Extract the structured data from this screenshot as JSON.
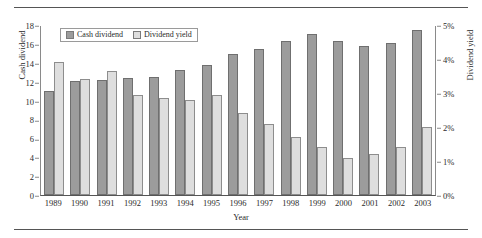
{
  "chart_data": {
    "type": "bar",
    "title": "",
    "subtitle": "",
    "xlabel": "Year",
    "ylabel": "Cash dividend",
    "y2label": "Dividend yield",
    "categories": [
      "1989",
      "1990",
      "1991",
      "1992",
      "1993",
      "1994",
      "1995",
      "1996",
      "1997",
      "1998",
      "1999",
      "2000",
      "2001",
      "2002",
      "2003"
    ],
    "ylim": [
      0,
      18
    ],
    "y2lim": [
      0,
      5
    ],
    "yticks": [
      "18",
      "16",
      "14",
      "12",
      "10",
      "8",
      "6",
      "4",
      "2",
      "0"
    ],
    "ytick_values": [
      18,
      16,
      14,
      12,
      10,
      8,
      6,
      4,
      2,
      0
    ],
    "y2ticks": [
      "5%",
      "4%",
      "3%",
      "2%",
      "1%",
      "0%"
    ],
    "y2tick_values": [
      5,
      4,
      3,
      2,
      1,
      0
    ],
    "grid": false,
    "legend_position": "top-left",
    "series": [
      {
        "name": "Cash dividend",
        "axis": "left",
        "color": "#9c9c9c",
        "values": [
          11.0,
          12.1,
          12.2,
          12.4,
          12.5,
          13.2,
          13.8,
          14.9,
          15.5,
          16.3,
          17.1,
          16.3,
          15.8,
          16.1,
          17.5
        ]
      },
      {
        "name": "Dividend yield",
        "axis": "right",
        "color": "#dedede",
        "values": [
          3.9,
          3.4,
          3.65,
          2.95,
          2.85,
          2.8,
          2.95,
          2.4,
          2.1,
          1.7,
          1.4,
          1.1,
          1.2,
          1.4,
          2.0
        ]
      }
    ]
  },
  "legend": {
    "items": [
      {
        "label": "Cash dividend",
        "swatch": "cash"
      },
      {
        "label": "Dividend yield",
        "swatch": "yield"
      }
    ]
  },
  "colors": {
    "cash_bar": "#9c9c9c",
    "yield_bar": "#dedede",
    "axis": "#555555",
    "text": "#2b2b2b"
  }
}
